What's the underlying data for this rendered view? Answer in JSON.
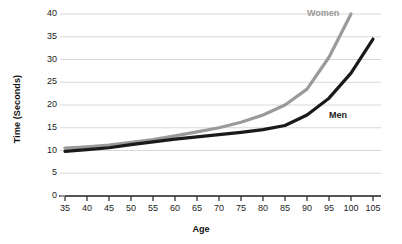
{
  "chart_data": {
    "type": "line",
    "title": "",
    "xlabel": "Age",
    "ylabel": "Time (Seconds)",
    "x": [
      35,
      40,
      45,
      50,
      55,
      60,
      65,
      70,
      75,
      80,
      85,
      90,
      95,
      100,
      105
    ],
    "xlim": [
      35,
      105
    ],
    "ylim": [
      0,
      40
    ],
    "xticks": [
      35,
      40,
      45,
      50,
      55,
      60,
      65,
      70,
      75,
      80,
      85,
      90,
      95,
      100,
      105
    ],
    "yticks": [
      0,
      5,
      10,
      15,
      20,
      25,
      30,
      35,
      40
    ],
    "grid": "horizontal",
    "legend_position": "inline-annotation",
    "series": [
      {
        "name": "Women",
        "color": "#9a9a9a",
        "values": [
          10.5,
          10.8,
          11.2,
          11.8,
          12.4,
          13.2,
          14.1,
          15.0,
          16.2,
          17.8,
          20.0,
          23.5,
          30.5,
          40.0,
          null
        ]
      },
      {
        "name": "Men",
        "color": "#1a1a1a",
        "values": [
          9.8,
          10.2,
          10.6,
          11.3,
          11.9,
          12.5,
          13.0,
          13.5,
          14.0,
          14.6,
          15.5,
          17.8,
          21.5,
          27.0,
          34.5
        ]
      }
    ],
    "annotations": [
      {
        "text": "Women",
        "x": 95,
        "y": 41.5,
        "color": "#9a9a9a"
      },
      {
        "text": "Men",
        "x": 100,
        "y": 17.5,
        "color": "#1a1a1a"
      }
    ],
    "colors": {
      "women": "#9a9a9a",
      "men": "#1a1a1a",
      "grid": "#d8d8d8",
      "axis": "#222222",
      "background": "#ffffff"
    }
  }
}
